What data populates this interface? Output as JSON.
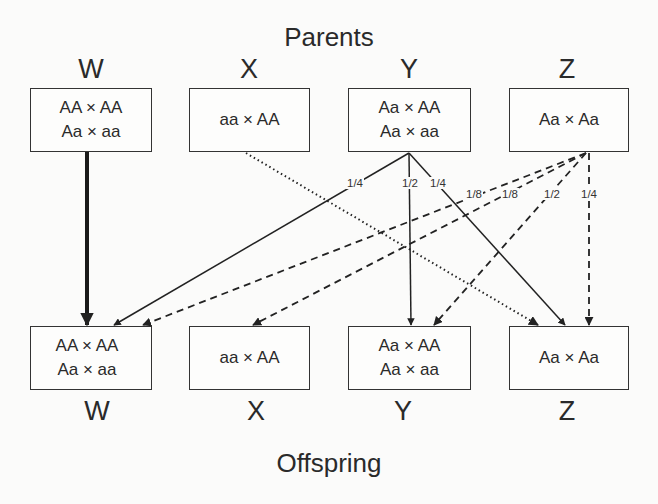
{
  "diagram": {
    "top_title": "Parents",
    "bottom_title": "Offspring",
    "parents": [
      {
        "id": "W",
        "label": "W",
        "crosses": [
          "AA × AA",
          "Aa × aa"
        ]
      },
      {
        "id": "X",
        "label": "X",
        "crosses": [
          "aa × AA"
        ]
      },
      {
        "id": "Y",
        "label": "Y",
        "crosses": [
          "Aa × AA",
          "Aa × aa"
        ]
      },
      {
        "id": "Z",
        "label": "Z",
        "crosses": [
          "Aa × Aa"
        ]
      }
    ],
    "offspring": [
      {
        "id": "W",
        "label": "W",
        "crosses": [
          "AA × AA",
          "Aa × aa"
        ]
      },
      {
        "id": "X",
        "label": "X",
        "crosses": [
          "aa × AA"
        ]
      },
      {
        "id": "Y",
        "label": "Y",
        "crosses": [
          "Aa × AA",
          "Aa × aa"
        ]
      },
      {
        "id": "Z",
        "label": "Z",
        "crosses": [
          "Aa × Aa"
        ]
      }
    ],
    "edges": [
      {
        "from": "W",
        "to": "W",
        "style": "thick-solid",
        "probability": ""
      },
      {
        "from": "X",
        "to": "Z",
        "style": "dotted",
        "probability": ""
      },
      {
        "from": "Y",
        "to": "W",
        "style": "solid",
        "probability": "1/4"
      },
      {
        "from": "Y",
        "to": "Y",
        "style": "solid",
        "probability": "1/2"
      },
      {
        "from": "Y",
        "to": "Z",
        "style": "solid",
        "probability": "1/4"
      },
      {
        "from": "Z",
        "to": "W",
        "style": "dashed",
        "probability": "1/8"
      },
      {
        "from": "Z",
        "to": "X",
        "style": "dashed",
        "probability": "1/8"
      },
      {
        "from": "Z",
        "to": "Y",
        "style": "dashed",
        "probability": "1/2"
      },
      {
        "from": "Z",
        "to": "Z",
        "style": "dashed",
        "probability": "1/4"
      }
    ]
  }
}
